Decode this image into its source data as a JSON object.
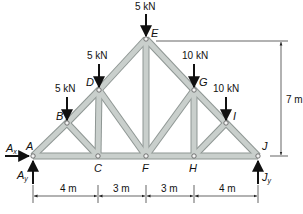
{
  "diagram": {
    "type": "roof-truss",
    "member_color": "#c9cfcc",
    "member_edge_color": "#8e9693",
    "arrow_color": "#111111",
    "nodes": [
      {
        "id": "A",
        "label": "A",
        "x": 33,
        "y": 156
      },
      {
        "id": "B",
        "label": "B",
        "x": 67,
        "y": 123
      },
      {
        "id": "C",
        "label": "C",
        "x": 98,
        "y": 156
      },
      {
        "id": "D",
        "label": "D",
        "x": 99,
        "y": 90
      },
      {
        "id": "E",
        "label": "E",
        "x": 146,
        "y": 39
      },
      {
        "id": "F",
        "label": "F",
        "x": 146,
        "y": 156
      },
      {
        "id": "G",
        "label": "G",
        "x": 194,
        "y": 90
      },
      {
        "id": "H",
        "label": "H",
        "x": 194,
        "y": 156
      },
      {
        "id": "I",
        "label": "I",
        "x": 226,
        "y": 123
      },
      {
        "id": "J",
        "label": "J",
        "x": 258,
        "y": 156
      }
    ],
    "members": [
      [
        "A",
        "B"
      ],
      [
        "B",
        "D"
      ],
      [
        "D",
        "E"
      ],
      [
        "E",
        "G"
      ],
      [
        "G",
        "I"
      ],
      [
        "I",
        "J"
      ],
      [
        "A",
        "C"
      ],
      [
        "C",
        "F"
      ],
      [
        "F",
        "H"
      ],
      [
        "H",
        "J"
      ],
      [
        "B",
        "C"
      ],
      [
        "C",
        "D"
      ],
      [
        "D",
        "F"
      ],
      [
        "E",
        "F"
      ],
      [
        "F",
        "G"
      ],
      [
        "G",
        "H"
      ],
      [
        "H",
        "I"
      ]
    ],
    "loads": [
      {
        "node": "B",
        "label": "5 kN"
      },
      {
        "node": "D",
        "label": "5 kN"
      },
      {
        "node": "E",
        "label": "5 kN"
      },
      {
        "node": "G",
        "label": "10 kN"
      },
      {
        "node": "I",
        "label": "10 kN"
      }
    ],
    "reactions": [
      {
        "label": "A",
        "subscript": "x",
        "direction": "horizontal"
      },
      {
        "label": "A",
        "subscript": "y",
        "direction": "vertical"
      },
      {
        "label": "J",
        "subscript": "y",
        "direction": "vertical"
      }
    ],
    "dimensions": {
      "horizontal": [
        "4 m",
        "3 m",
        "3 m",
        "4 m"
      ],
      "vertical": "7 m"
    }
  }
}
